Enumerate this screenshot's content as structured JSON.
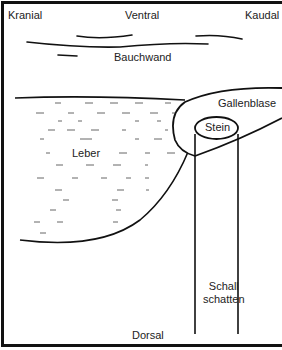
{
  "diagram": {
    "orientation": {
      "top_left": "Kranial",
      "top_center": "Ventral",
      "top_right": "Kaudal",
      "bottom_center": "Dorsal"
    },
    "structures": {
      "abdominal_wall": "Bauchwand",
      "liver": "Leber",
      "gallbladder": "Gallenblase",
      "stone": "Stein",
      "acoustic_shadow_line1": "Schall",
      "acoustic_shadow_line2": "schatten"
    },
    "colors": {
      "line": "#111111",
      "text": "#222222",
      "hatch": "#555555",
      "background": "#ffffff"
    }
  }
}
